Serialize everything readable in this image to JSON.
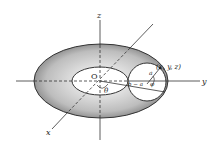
{
  "diagram": {
    "type": "torus-coordinate-figure",
    "axes": {
      "x_label": "x",
      "y_label": "y",
      "z_label": "z"
    },
    "origin_label": "O",
    "angle_theta": "θ",
    "angle_phi": "φ",
    "radius_minor": "a",
    "distance_label": "b − a",
    "point_label": "(x, y, z)",
    "colors": {
      "torus_fill": "#9a9a9a",
      "torus_edge": "#333333",
      "line": "#333333",
      "background": "#ffffff"
    }
  }
}
